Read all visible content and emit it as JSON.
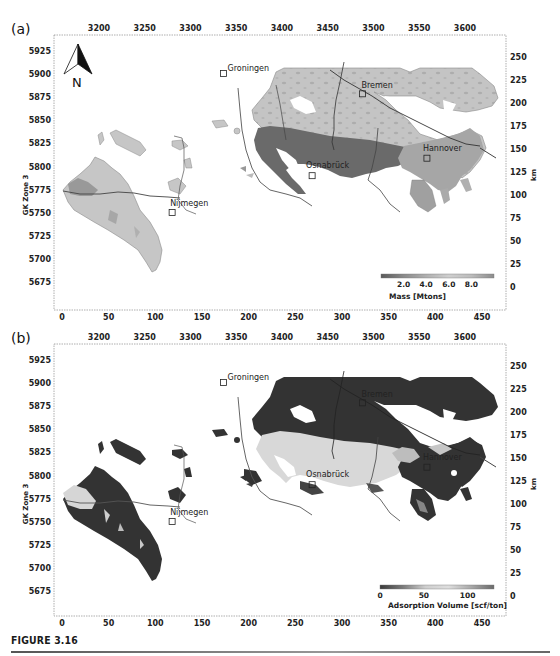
{
  "figure": {
    "caption": "FIGURE 3.16"
  },
  "chart_data": [
    {
      "type": "heatmap",
      "panel_label": "(a)",
      "title": "",
      "xlabel_bottom": "",
      "xlabel_top": "",
      "ylabel_left": "GK Zone 3",
      "ylabel_right": "km",
      "x_bottom_ticks": [
        "0",
        "50",
        "100",
        "150",
        "200",
        "250",
        "300",
        "350",
        "400",
        "450"
      ],
      "x_top_ticks": [
        "3200",
        "3250",
        "3300",
        "3350",
        "3400",
        "3450",
        "3500",
        "3550",
        "3600"
      ],
      "y_left_ticks": [
        "5925",
        "5900",
        "5875",
        "5850",
        "5825",
        "5800",
        "5775",
        "5750",
        "5725",
        "5700",
        "5675"
      ],
      "y_right_ticks": [
        "250",
        "225",
        "200",
        "175",
        "150",
        "125",
        "100",
        "75",
        "50",
        "25",
        "0"
      ],
      "x_bottom_range": [
        0,
        470
      ],
      "y_right_range": [
        0,
        270
      ],
      "north_arrow": "N",
      "cities": [
        {
          "name": "Groningen",
          "x_km": 173,
          "y_km": 232
        },
        {
          "name": "Bremen",
          "x_km": 322,
          "y_km": 210
        },
        {
          "name": "Osnabrück",
          "x_km": 268,
          "y_km": 121
        },
        {
          "name": "Hannover",
          "x_km": 391,
          "y_km": 140
        },
        {
          "name": "Nijmegen",
          "x_km": 118,
          "y_km": 81
        }
      ],
      "colorbar": {
        "label": "Mass [Mtons]",
        "ticks": [
          "2.0",
          "4.0",
          "6.0",
          "8.0"
        ],
        "range": [
          0,
          10
        ],
        "colors": [
          "#5a5a5a",
          "#8a8a8a",
          "#b0b0b0",
          "#cfcfcf",
          "#bcbcbc",
          "#8c8c8c"
        ]
      },
      "regions": [
        {
          "name": "west-basin",
          "mean_value_level": "low",
          "fill": "#c8c8c8"
        },
        {
          "name": "central-north-basin",
          "mean_value_level": "low-medium",
          "fill": "#c4c4c4"
        },
        {
          "name": "southern-belt-osnabruck",
          "mean_value_level": "high",
          "fill": "#6e6e6e"
        },
        {
          "name": "hannover-east",
          "mean_value_level": "medium",
          "fill": "#a5a5a5"
        }
      ]
    },
    {
      "type": "heatmap",
      "panel_label": "(b)",
      "title": "",
      "xlabel_bottom": "",
      "xlabel_top": "",
      "ylabel_left": "GK Zone 3",
      "ylabel_right": "km",
      "x_bottom_ticks": [
        "0",
        "50",
        "100",
        "150",
        "200",
        "250",
        "300",
        "350",
        "400",
        "450"
      ],
      "x_top_ticks": [
        "3200",
        "3250",
        "3300",
        "3350",
        "3400",
        "3450",
        "3500",
        "3550",
        "3600"
      ],
      "y_left_ticks": [
        "5925",
        "5900",
        "5875",
        "5850",
        "5825",
        "5800",
        "5775",
        "5750",
        "5725",
        "5700",
        "5675"
      ],
      "y_right_ticks": [
        "250",
        "225",
        "200",
        "175",
        "150",
        "125",
        "100",
        "75",
        "50",
        "25",
        "0"
      ],
      "x_bottom_range": [
        0,
        470
      ],
      "y_right_range": [
        0,
        270
      ],
      "cities": [
        {
          "name": "Groningen",
          "x_km": 173,
          "y_km": 232
        },
        {
          "name": "Bremen",
          "x_km": 322,
          "y_km": 210
        },
        {
          "name": "Osnabrück",
          "x_km": 268,
          "y_km": 121
        },
        {
          "name": "Hannover",
          "x_km": 391,
          "y_km": 140
        },
        {
          "name": "Nijmegen",
          "x_km": 118,
          "y_km": 81
        }
      ],
      "colorbar": {
        "label": "Adsorption Volume [scf/ton]",
        "ticks": [
          "0",
          "50",
          "100"
        ],
        "range": [
          0,
          130
        ],
        "colors": [
          "#3a3a3a",
          "#7a7a7a",
          "#cfcfcf",
          "#dedede",
          "#a8a8a8",
          "#6a6a6a"
        ]
      },
      "regions": [
        {
          "name": "west-basin",
          "mean_value_level": "low",
          "fill": "#333333"
        },
        {
          "name": "central-north-basin",
          "mean_value_level": "low",
          "fill": "#333333"
        },
        {
          "name": "southern-belt-osnabruck",
          "mean_value_level": "high",
          "fill": "#d9d9d9"
        },
        {
          "name": "hannover-east",
          "mean_value_level": "low-medium",
          "fill": "#3a3a3a"
        }
      ]
    }
  ]
}
